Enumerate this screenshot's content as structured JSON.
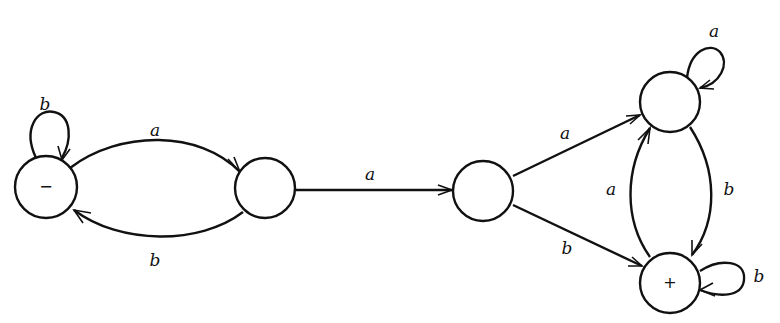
{
  "diagram": {
    "type": "finite-automaton",
    "alphabet": [
      "a",
      "b"
    ],
    "states": [
      {
        "id": "s1",
        "mark": "−",
        "role": "start"
      },
      {
        "id": "s2",
        "mark": ""
      },
      {
        "id": "s3",
        "mark": ""
      },
      {
        "id": "s4",
        "mark": ""
      },
      {
        "id": "s5",
        "mark": "+",
        "role": "final"
      }
    ],
    "transitions": [
      {
        "from": "s1",
        "to": "s1",
        "label": "b"
      },
      {
        "from": "s1",
        "to": "s2",
        "label": "a"
      },
      {
        "from": "s2",
        "to": "s1",
        "label": "b"
      },
      {
        "from": "s2",
        "to": "s3",
        "label": "a"
      },
      {
        "from": "s3",
        "to": "s4",
        "label": "a"
      },
      {
        "from": "s3",
        "to": "s5",
        "label": "b"
      },
      {
        "from": "s4",
        "to": "s4",
        "label": "a"
      },
      {
        "from": "s4",
        "to": "s5",
        "label": "b"
      },
      {
        "from": "s5",
        "to": "s4",
        "label": "a"
      },
      {
        "from": "s5",
        "to": "s5",
        "label": "b"
      }
    ]
  },
  "labels": {
    "s1_mark": "−",
    "s5_mark": "+",
    "e_s1_loop": "b",
    "e_s1_s2": "a",
    "e_s2_s1": "b",
    "e_s2_s3": "a",
    "e_s3_s4": "a",
    "e_s3_s5": "b",
    "e_s4_loop": "a",
    "e_s4_s5": "b",
    "e_s5_s4": "a",
    "e_s5_loop": "b"
  }
}
